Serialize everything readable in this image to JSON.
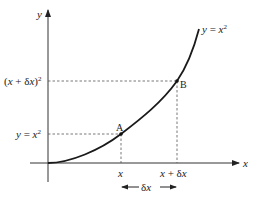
{
  "diagram": {
    "curve_label": "y = x²",
    "axes": {
      "x_label": "x",
      "y_label": "y"
    },
    "points": [
      {
        "name": "A",
        "x_label": "x",
        "y_label": "y = x²"
      },
      {
        "name": "B",
        "x_label": "x + δx",
        "y_label": "(x + δx)²"
      }
    ],
    "increment_label": "δx",
    "colors": {
      "curve": "#1a1a1a",
      "axes": "#333333",
      "dashed": "#555555",
      "background": "#ffffff"
    }
  }
}
